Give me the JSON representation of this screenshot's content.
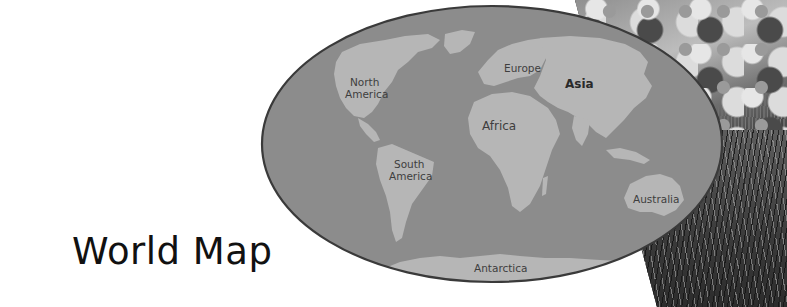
{
  "title": "World Map",
  "map": {
    "ocean_color": "#8c8c8c",
    "land_color": "#b6b6b6",
    "border_color": "#3a3a3a",
    "labels": [
      {
        "id": "north-america",
        "lines": [
          "North",
          "America"
        ],
        "bold": false
      },
      {
        "id": "europe",
        "lines": [
          "Europe"
        ],
        "bold": false
      },
      {
        "id": "asia",
        "lines": [
          "Asia"
        ],
        "bold": true
      },
      {
        "id": "africa",
        "lines": [
          "Africa"
        ],
        "bold": false
      },
      {
        "id": "south-america",
        "lines": [
          "South",
          "America"
        ],
        "bold": false
      },
      {
        "id": "australia",
        "lines": [
          "Australia"
        ],
        "bold": false
      },
      {
        "id": "antarctica",
        "lines": [
          "Antarctica"
        ],
        "bold": false
      }
    ]
  },
  "labels": {
    "north_america_1": "North",
    "north_america_2": "America",
    "europe": "Europe",
    "asia": "Asia",
    "africa": "Africa",
    "south_america_1": "South",
    "south_america_2": "America",
    "australia": "Australia",
    "antarctica": "Antarctica"
  },
  "photo": {
    "description": "grayscale photo of grass and rocks"
  }
}
